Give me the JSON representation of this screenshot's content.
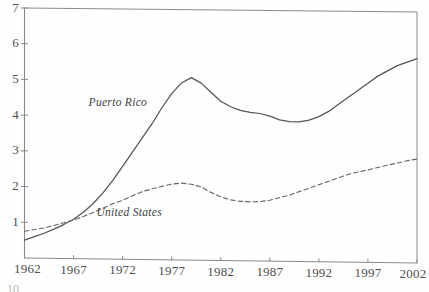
{
  "chart_data": {
    "type": "line",
    "title": "",
    "subtitle": "",
    "xlabel": "",
    "ylabel": "",
    "xlim": [
      1962,
      2002
    ],
    "ylim": [
      0,
      7
    ],
    "grid": false,
    "legend_position": "inline-annotation",
    "xticks": [
      "1962",
      "1967",
      "1972",
      "1977",
      "1982",
      "1987",
      "1992",
      "1997",
      "2002"
    ],
    "xtick_values": [
      1962,
      1967,
      1972,
      1977,
      1982,
      1987,
      1992,
      1997,
      2002
    ],
    "yticks": [
      "1",
      "2",
      "3",
      "4",
      "5",
      "6",
      "7"
    ],
    "ytick_values": [
      1,
      2,
      3,
      4,
      5,
      6,
      7
    ],
    "x_minor_tick_interval": 5,
    "annotations": [
      {
        "text": "Puerto Rico",
        "x": 1972.2,
        "y": 4.35
      },
      {
        "text": "United States",
        "x": 1973.0,
        "y": 1.28
      }
    ],
    "series": [
      {
        "name": "Puerto Rico",
        "style": "solid",
        "color": "#555555",
        "x": [
          1962,
          1963,
          1964,
          1965,
          1966,
          1967,
          1968,
          1969,
          1970,
          1971,
          1972,
          1973,
          1974,
          1975,
          1976,
          1977,
          1978,
          1979,
          1980,
          1981,
          1982,
          1983,
          1984,
          1985,
          1986,
          1987,
          1988,
          1989,
          1990,
          1991,
          1992,
          1993,
          1994,
          1995,
          1996,
          1997,
          1998,
          1999,
          2000,
          2001,
          2002
        ],
        "values": [
          0.5,
          0.6,
          0.7,
          0.82,
          0.95,
          1.1,
          1.3,
          1.55,
          1.85,
          2.2,
          2.6,
          3.0,
          3.4,
          3.8,
          4.25,
          4.65,
          4.95,
          5.1,
          4.95,
          4.7,
          4.45,
          4.3,
          4.2,
          4.15,
          4.12,
          4.05,
          3.95,
          3.9,
          3.9,
          3.95,
          4.05,
          4.2,
          4.4,
          4.6,
          4.8,
          5.0,
          5.2,
          5.35,
          5.5,
          5.6,
          5.7
        ]
      },
      {
        "name": "United States",
        "style": "dashed",
        "color": "#666666",
        "x": [
          1962,
          1963,
          1964,
          1965,
          1966,
          1967,
          1968,
          1969,
          1970,
          1971,
          1972,
          1973,
          1974,
          1975,
          1976,
          1977,
          1978,
          1979,
          1980,
          1981,
          1982,
          1983,
          1984,
          1985,
          1986,
          1987,
          1988,
          1989,
          1990,
          1991,
          1992,
          1993,
          1994,
          1995,
          1996,
          1997,
          1998,
          1999,
          2000,
          2001,
          2002
        ],
        "values": [
          0.75,
          0.8,
          0.85,
          0.92,
          1.0,
          1.08,
          1.18,
          1.3,
          1.42,
          1.55,
          1.65,
          1.78,
          1.9,
          1.98,
          2.05,
          2.12,
          2.15,
          2.12,
          2.05,
          1.9,
          1.78,
          1.7,
          1.66,
          1.65,
          1.66,
          1.7,
          1.78,
          1.85,
          1.95,
          2.05,
          2.15,
          2.25,
          2.35,
          2.45,
          2.52,
          2.58,
          2.65,
          2.72,
          2.78,
          2.85,
          2.9
        ]
      }
    ]
  },
  "axes": {
    "frame_color": "#8a8a8a",
    "tick_color": "#8a8a8a"
  },
  "artifact": {
    "footnote_fragment": "10"
  }
}
